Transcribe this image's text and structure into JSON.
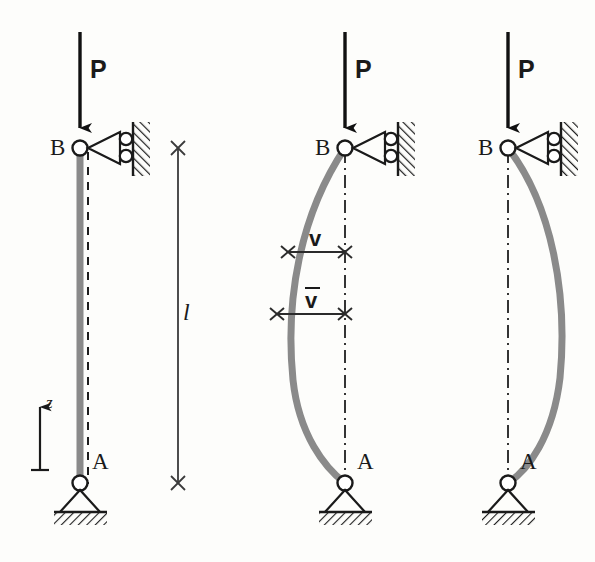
{
  "figure": {
    "colors": {
      "column": "#8a8a8a",
      "ink": "#1a1a1a",
      "background": "#fdfdfb",
      "centerline": "#2b2b2b"
    },
    "panels": [
      {
        "id": "undeformed",
        "name": "undeformed-column",
        "load_label": "P",
        "top_node_label": "B",
        "bottom_node_label": "A",
        "top_support": "roller-against-wall",
        "bottom_support": "pin",
        "column_state": "straight",
        "reference_line": "dashed"
      },
      {
        "id": "buckled-left",
        "name": "buckled-column-small-deflection",
        "load_label": "P",
        "top_node_label": "B",
        "bottom_node_label": "A",
        "top_support": "roller-against-wall",
        "bottom_support": "pin",
        "column_state": "buckled-left",
        "reference_line": "dash-dot",
        "deflection_labels": [
          {
            "symbol": "v",
            "overbar": false
          },
          {
            "symbol": "v",
            "overbar": true
          }
        ]
      },
      {
        "id": "buckled-right",
        "name": "buckled-column-large-deflection",
        "load_label": "P",
        "top_node_label": "B",
        "bottom_node_label": "A",
        "top_support": "roller-against-wall",
        "bottom_support": "pin",
        "column_state": "buckled-right",
        "reference_line": "dash-dot"
      }
    ],
    "dimension": {
      "name": "length-dimension",
      "label": "l",
      "description": "column length between supports A and B"
    },
    "axis": {
      "name": "z-axis",
      "label": "z",
      "direction": "up"
    }
  }
}
